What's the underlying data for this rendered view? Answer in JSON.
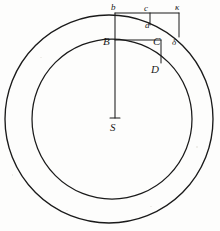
{
  "figure": {
    "background_color": "#fdfdfc",
    "ink_color": "#1a1a1a",
    "labels": [
      {
        "id": "b",
        "text": "b",
        "x": 111,
        "y": 3,
        "kind": "lowercase"
      },
      {
        "id": "c",
        "text": "c",
        "x": 144,
        "y": 4,
        "kind": "lowercase"
      },
      {
        "id": "kappa",
        "text": "κ",
        "x": 175,
        "y": 3,
        "kind": "greek"
      },
      {
        "id": "d",
        "text": "d",
        "x": 145,
        "y": 21,
        "kind": "lowercase"
      },
      {
        "id": "B",
        "text": "B",
        "x": 103,
        "y": 36,
        "kind": "capital"
      },
      {
        "id": "C",
        "text": "C",
        "x": 153,
        "y": 36,
        "kind": "capital"
      },
      {
        "id": "delta",
        "text": "δ",
        "x": 172,
        "y": 38,
        "kind": "greek"
      },
      {
        "id": "D",
        "text": "D",
        "x": 151,
        "y": 64,
        "kind": "capital"
      },
      {
        "id": "S",
        "text": "S",
        "x": 110,
        "y": 122,
        "kind": "capital"
      }
    ],
    "geometry": {
      "center": {
        "x": 115,
        "y": 119
      },
      "outer_circle": {
        "cx": 109,
        "cy": 119,
        "r": 104
      },
      "inner_circle": {
        "cx": 112,
        "cy": 119,
        "r": 80
      },
      "radius_line": {
        "x1": 115,
        "y1": 13,
        "x2": 115,
        "y2": 118
      },
      "center_tick": {
        "x1": 110,
        "y1": 118,
        "x2": 120,
        "y2": 118
      },
      "upper_chord": {
        "x1": 115,
        "y1": 13,
        "x2": 179,
        "y2": 13
      },
      "upper_drop_c": {
        "x1": 150,
        "y1": 13,
        "x2": 150,
        "y2": 25
      },
      "upper_drop_kappa": {
        "x1": 179,
        "y1": 13,
        "x2": 179,
        "y2": 37
      },
      "lower_chord": {
        "x1": 115,
        "y1": 40,
        "x2": 161,
        "y2": 40
      },
      "lower_drop_D": {
        "x1": 161,
        "y1": 40,
        "x2": 161,
        "y2": 63
      }
    }
  }
}
